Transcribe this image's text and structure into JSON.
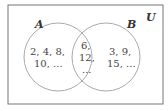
{
  "diagram": {
    "type": "venn",
    "universe_label": "U",
    "sets": [
      {
        "label": "A",
        "only_elements": [
          "2, 4, 8,",
          "10, ..."
        ]
      },
      {
        "label": "B",
        "only_elements": [
          "3, 9,",
          "15, ..."
        ]
      }
    ],
    "intersection": [
      "6,",
      "12,",
      "..."
    ],
    "colors": {
      "stroke_rect": "#666666",
      "stroke_circle": "#999999",
      "text": "#444444"
    }
  }
}
